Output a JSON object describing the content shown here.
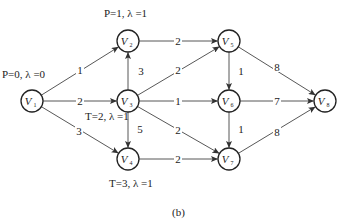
{
  "nodes": [
    {
      "id": "V1",
      "letter": "V",
      "sub": "1",
      "x": 32,
      "y": 101
    },
    {
      "id": "V2",
      "letter": "V",
      "sub": "2",
      "x": 128,
      "y": 41
    },
    {
      "id": "V3",
      "letter": "V",
      "sub": "3",
      "x": 128,
      "y": 101
    },
    {
      "id": "V4",
      "letter": "V",
      "sub": "4",
      "x": 128,
      "y": 159
    },
    {
      "id": "V5",
      "letter": "V",
      "sub": "5",
      "x": 229,
      "y": 41
    },
    {
      "id": "V6",
      "letter": "V",
      "sub": "6",
      "x": 229,
      "y": 101
    },
    {
      "id": "V7",
      "letter": "V",
      "sub": "7",
      "x": 229,
      "y": 159
    },
    {
      "id": "V8",
      "letter": "V",
      "sub": "8",
      "x": 325,
      "y": 101
    }
  ],
  "edges": [
    {
      "from": "V1",
      "to": "V2",
      "weight": "1",
      "lx": 80,
      "ly": 70
    },
    {
      "from": "V1",
      "to": "V3",
      "weight": "2",
      "lx": 80,
      "ly": 101
    },
    {
      "from": "V1",
      "to": "V4",
      "weight": "3",
      "lx": 79,
      "ly": 131
    },
    {
      "from": "V3",
      "to": "V2",
      "weight": "3",
      "lx": 141,
      "ly": 71
    },
    {
      "from": "V3",
      "to": "V4",
      "weight": "5",
      "lx": 140,
      "ly": 129
    },
    {
      "from": "V2",
      "to": "V5",
      "weight": "2",
      "lx": 178,
      "ly": 41
    },
    {
      "from": "V3",
      "to": "V5",
      "weight": "2",
      "lx": 178,
      "ly": 70
    },
    {
      "from": "V3",
      "to": "V6",
      "weight": "1",
      "lx": 178,
      "ly": 101
    },
    {
      "from": "V3",
      "to": "V7",
      "weight": "2",
      "lx": 178,
      "ly": 130
    },
    {
      "from": "V4",
      "to": "V7",
      "weight": "2",
      "lx": 178,
      "ly": 159
    },
    {
      "from": "V5",
      "to": "V6",
      "weight": "1",
      "lx": 241,
      "ly": 71
    },
    {
      "from": "V6",
      "to": "V7",
      "weight": "1",
      "lx": 241,
      "ly": 129
    },
    {
      "from": "V5",
      "to": "V8",
      "weight": "8",
      "lx": 277,
      "ly": 67
    },
    {
      "from": "V6",
      "to": "V8",
      "weight": "7",
      "lx": 277,
      "ly": 101
    },
    {
      "from": "V7",
      "to": "V8",
      "weight": "8",
      "lx": 277,
      "ly": 132
    }
  ],
  "annotations": {
    "v1": "P=0, λ =0",
    "v2": "P=1, λ =1",
    "v3": "T=2, λ =1",
    "v4": "T=3, λ =1"
  },
  "caption": "(b)"
}
